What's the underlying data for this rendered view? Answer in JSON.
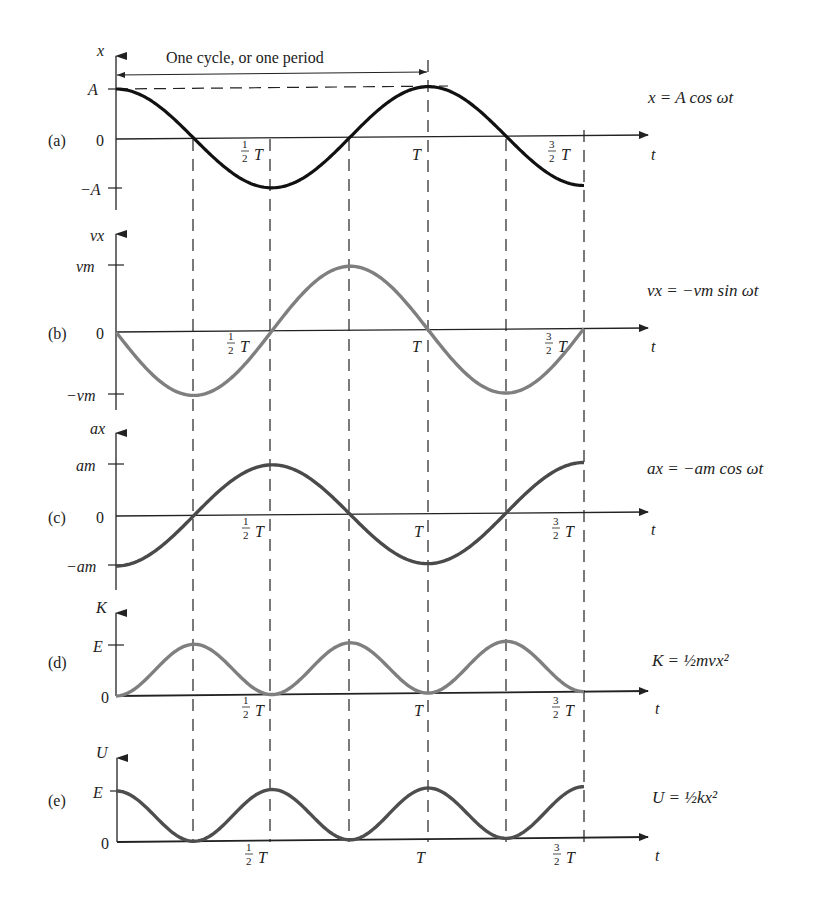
{
  "figure": {
    "period_label": "One cycle, or one period",
    "time_axis_label": "t",
    "time_ticks": [
      "½T",
      "T",
      "³⁄₂T"
    ],
    "half": {
      "num": "1",
      "den": "2"
    },
    "three_half": {
      "num": "3",
      "den": "2"
    },
    "T": "T",
    "colors": {
      "a": "#111111",
      "b": "#7f7f7f",
      "c": "#4a4a4a",
      "d": "#7f7f7f",
      "e": "#4e4e4e",
      "axis": "#222222",
      "dash": "#333333"
    }
  },
  "panels": [
    {
      "id": "a",
      "tag": "(a)",
      "y_axis_label": "x",
      "ticks": {
        "top": "A",
        "zero": "0",
        "bottom": "−A"
      },
      "equation": "x = A cos ωt"
    },
    {
      "id": "b",
      "tag": "(b)",
      "y_axis_label": "vx",
      "ticks": {
        "top": "vm",
        "zero": "0",
        "bottom": "−vm"
      },
      "equation": "vx = −vm sin ωt"
    },
    {
      "id": "c",
      "tag": "(c)",
      "y_axis_label": "ax",
      "ticks": {
        "top": "am",
        "zero": "0",
        "bottom": "−am"
      },
      "equation": "ax = −am cos ωt"
    },
    {
      "id": "d",
      "tag": "(d)",
      "y_axis_label": "K",
      "ticks": {
        "top": "E",
        "zero": "0"
      },
      "equation": "K = ½mvx²"
    },
    {
      "id": "e",
      "tag": "(e)",
      "y_axis_label": "U",
      "ticks": {
        "top": "E",
        "zero": "0"
      },
      "equation": "U = ½kx²"
    }
  ],
  "chart_data": [
    {
      "type": "line",
      "title": "(a) position",
      "xlabel": "t",
      "ylabel": "x",
      "x": [
        "0",
        "T/4",
        "T/2",
        "3T/4",
        "T",
        "5T/4",
        "3T/2"
      ],
      "values": [
        1,
        0,
        -1,
        0,
        1,
        0,
        -1
      ],
      "function": "x = A cos ωt",
      "ylim": [
        "-A",
        "A"
      ]
    },
    {
      "type": "line",
      "title": "(b) velocity",
      "xlabel": "t",
      "ylabel": "vx",
      "x": [
        "0",
        "T/4",
        "T/2",
        "3T/4",
        "T",
        "5T/4",
        "3T/2"
      ],
      "values": [
        0,
        -1,
        0,
        1,
        0,
        -1,
        0
      ],
      "function": "vx = −vm sin ωt",
      "ylim": [
        "-vm",
        "vm"
      ]
    },
    {
      "type": "line",
      "title": "(c) acceleration",
      "xlabel": "t",
      "ylabel": "ax",
      "x": [
        "0",
        "T/4",
        "T/2",
        "3T/4",
        "T",
        "5T/4",
        "3T/2"
      ],
      "values": [
        -1,
        0,
        1,
        0,
        -1,
        0,
        1
      ],
      "function": "ax = −am cos ωt",
      "ylim": [
        "-am",
        "am"
      ]
    },
    {
      "type": "line",
      "title": "(d) kinetic energy",
      "xlabel": "t",
      "ylabel": "K",
      "x": [
        "0",
        "T/4",
        "T/2",
        "3T/4",
        "T",
        "5T/4",
        "3T/2"
      ],
      "values": [
        0,
        1,
        0,
        1,
        0,
        1,
        0
      ],
      "function": "K = ½ m vx²",
      "ylim": [
        "0",
        "E"
      ]
    },
    {
      "type": "line",
      "title": "(e) potential energy",
      "xlabel": "t",
      "ylabel": "U",
      "x": [
        "0",
        "T/4",
        "T/2",
        "3T/4",
        "T",
        "5T/4",
        "3T/2"
      ],
      "values": [
        1,
        0,
        1,
        0,
        1,
        0,
        1
      ],
      "function": "U = ½ k x²",
      "ylim": [
        "0",
        "E"
      ]
    }
  ]
}
